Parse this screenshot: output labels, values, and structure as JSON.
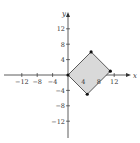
{
  "chart_data": {
    "type": "scatter",
    "title": "",
    "xlabel": "x",
    "ylabel": "y",
    "xlim": [
      -16,
      16
    ],
    "ylim": [
      -16,
      16
    ],
    "grid": false,
    "x_ticks": [
      -12,
      -8,
      -4,
      4,
      8,
      12
    ],
    "y_ticks": [
      12,
      8,
      4,
      -4,
      -8,
      -12
    ],
    "series": [
      {
        "name": "shaded rectangle (vertices approximate)",
        "kind": "filled-polygon",
        "points": [
          {
            "x": 0,
            "y": 0
          },
          {
            "x": 6,
            "y": 6
          },
          {
            "x": 11,
            "y": 1
          },
          {
            "x": 5,
            "y": -5
          }
        ],
        "fill": "#d9d9d9",
        "stroke": "#333333"
      }
    ]
  },
  "colors": {
    "axis": "#333333",
    "fill": "#d9d9d9",
    "point": "#111111"
  }
}
